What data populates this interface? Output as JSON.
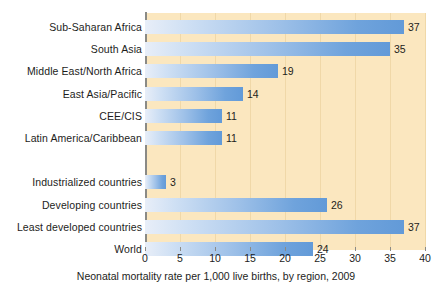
{
  "chart_data": {
    "type": "bar",
    "orientation": "horizontal",
    "title": "",
    "xlabel": "Neonatal mortality rate per 1,000 live births, by region, 2009",
    "ylabel": "",
    "xlim": [
      0,
      40
    ],
    "xticks": [
      0,
      5,
      10,
      15,
      20,
      25,
      30,
      35,
      40
    ],
    "xtick_labels": [
      "0",
      "5",
      "10",
      "15",
      "20",
      "25",
      "30",
      "35",
      "40"
    ],
    "grid": true,
    "grid_axis": "x",
    "legend": null,
    "categories": [
      "Sub-Saharan Africa",
      "South Asia",
      "Middle East/North Africa",
      "East Asia/Pacific",
      "CEE/CIS",
      "Latin America/Caribbean",
      "Industrialized countries",
      "Developing countries",
      "Least developed countries",
      "World"
    ],
    "values": [
      37,
      35,
      19,
      14,
      11,
      11,
      3,
      26,
      37,
      24
    ],
    "value_labels": [
      "37",
      "35",
      "19",
      "14",
      "11",
      "11",
      "3",
      "26",
      "37",
      "24"
    ],
    "groups": [
      {
        "name": "regions",
        "categories": [
          "Sub-Saharan Africa",
          "South Asia",
          "Middle East/North Africa",
          "East Asia/Pacific",
          "CEE/CIS",
          "Latin America/Caribbean"
        ],
        "values": [
          37,
          35,
          19,
          14,
          11,
          11
        ]
      },
      {
        "name": "aggregates",
        "categories": [
          "Industrialized countries",
          "Developing countries",
          "Least developed countries",
          "World"
        ],
        "values": [
          3,
          26,
          37,
          24
        ]
      }
    ],
    "bars": [
      {
        "label": "Sub-Saharan Africa",
        "value": 37,
        "value_label": "37",
        "group": 0,
        "row": 0
      },
      {
        "label": "South Asia",
        "value": 35,
        "value_label": "35",
        "group": 0,
        "row": 1
      },
      {
        "label": "Middle East/North Africa",
        "value": 19,
        "value_label": "19",
        "group": 0,
        "row": 2
      },
      {
        "label": "East Asia/Pacific",
        "value": 14,
        "value_label": "14",
        "group": 0,
        "row": 3
      },
      {
        "label": "CEE/CIS",
        "value": 11,
        "value_label": "11",
        "group": 0,
        "row": 4
      },
      {
        "label": "Latin America/Caribbean",
        "value": 11,
        "value_label": "11",
        "group": 0,
        "row": 5
      },
      {
        "label": "Industrialized countries",
        "value": 3,
        "value_label": "3",
        "group": 1,
        "row": 7
      },
      {
        "label": "Developing countries",
        "value": 26,
        "value_label": "26",
        "group": 1,
        "row": 8
      },
      {
        "label": "Least developed countries",
        "value": 37,
        "value_label": "37",
        "group": 1,
        "row": 9
      },
      {
        "label": "World",
        "value": 24,
        "value_label": "24",
        "group": 1,
        "row": 10
      }
    ],
    "colors": {
      "plot_background": "#fbe7bf",
      "gridline": "#f0d8a8",
      "axis": "#8a8a86",
      "bar_gradient_start": "#e8eef8",
      "bar_gradient_end": "#629ad8",
      "text": "#1d1d1b",
      "page_background": "#ffffff"
    }
  }
}
